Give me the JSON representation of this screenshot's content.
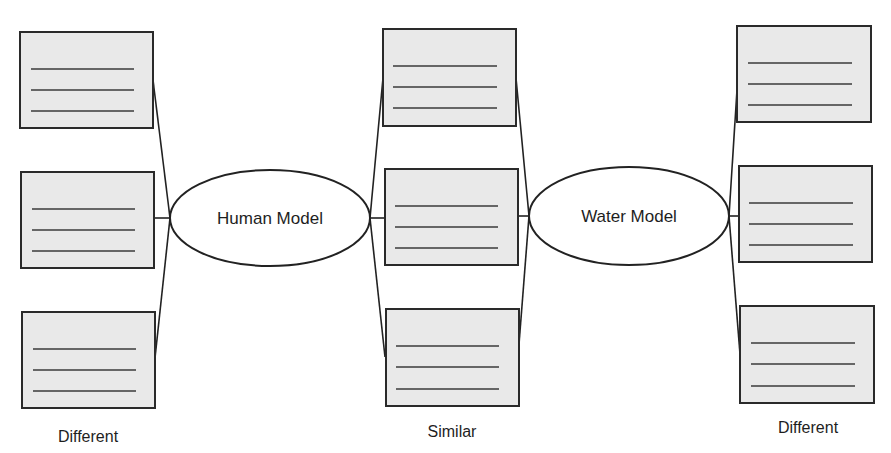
{
  "diagram": {
    "type": "double-bubble compare/contrast map",
    "center_nodes": [
      {
        "id": "human",
        "label": "Human Model"
      },
      {
        "id": "water",
        "label": "Water Model"
      }
    ],
    "columns": [
      {
        "id": "left",
        "label": "Different",
        "box_count": 3,
        "lines_per_box": 3,
        "connected_to": [
          "human"
        ]
      },
      {
        "id": "middle",
        "label": "Similar",
        "box_count": 3,
        "lines_per_box": 3,
        "connected_to": [
          "human",
          "water"
        ]
      },
      {
        "id": "right",
        "label": "Different",
        "box_count": 3,
        "lines_per_box": 3,
        "connected_to": [
          "water"
        ]
      }
    ],
    "colors": {
      "box_fill": "#e9e9e9",
      "stroke": "#222222",
      "background": "#ffffff"
    }
  }
}
